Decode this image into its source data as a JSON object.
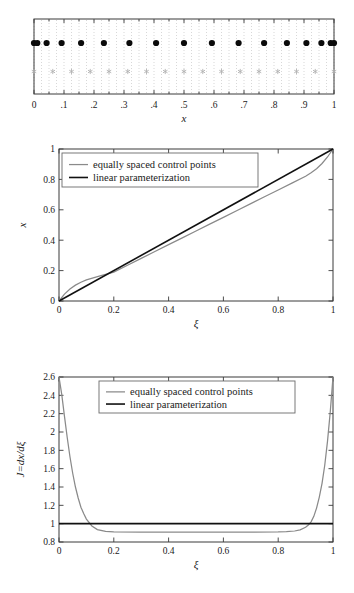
{
  "figure": {
    "caption_present": false,
    "panels": [
      "control-point-distribution",
      "parameterization-map",
      "jacobian"
    ]
  },
  "legend": {
    "entries": [
      {
        "label": "equally spaced control points",
        "color": "#8a8a8a",
        "style": "thin-gray-line"
      },
      {
        "label": "linear parameterization",
        "color": "#111111",
        "style": "thick-black-line"
      }
    ]
  },
  "chart_data": [
    {
      "id": "panel-top",
      "type": "scatter",
      "title": "",
      "xlabel": "x",
      "ylabel": "",
      "xlim": [
        0,
        1
      ],
      "ylim": [
        0,
        1
      ],
      "grid": true,
      "xticks": [
        0,
        0.1,
        0.2,
        0.3,
        0.4,
        0.5,
        0.6,
        0.7,
        0.8,
        0.9,
        1
      ],
      "xticklabels": [
        "0",
        ".1",
        ".2",
        ".3",
        ".4",
        ".5",
        ".6",
        ".7",
        ".8",
        ".9",
        "1"
      ],
      "yticks": [],
      "yticklabels": [],
      "series": [
        {
          "name": "equally spaced control points",
          "marker": "filled-circle",
          "color": "#0b0b0b",
          "y": 0.68,
          "x": [
            0.0,
            0.011,
            0.042,
            0.092,
            0.157,
            0.233,
            0.318,
            0.407,
            0.5,
            0.593,
            0.682,
            0.767,
            0.843,
            0.908,
            0.958,
            0.989,
            1.0
          ]
        },
        {
          "name": "linear parameterization",
          "marker": "asterisk",
          "color": "#b2b2b2",
          "y": 0.3,
          "x": [
            0.0,
            0.0625,
            0.125,
            0.1875,
            0.25,
            0.3125,
            0.375,
            0.4375,
            0.5,
            0.5625,
            0.625,
            0.6875,
            0.75,
            0.8125,
            0.875,
            0.9375,
            1.0
          ]
        }
      ]
    },
    {
      "id": "panel-middle",
      "type": "line",
      "title": "",
      "xlabel": "ξ",
      "ylabel": "x",
      "xlim": [
        0,
        1
      ],
      "ylim": [
        0,
        1
      ],
      "grid": false,
      "xticks": [
        0,
        0.2,
        0.4,
        0.6,
        0.8,
        1
      ],
      "xticklabels": [
        "0",
        "0.2",
        "0.4",
        "0.6",
        "0.8",
        "1"
      ],
      "yticks": [
        0,
        0.2,
        0.4,
        0.6,
        0.8,
        1
      ],
      "yticklabels": [
        "0",
        "0.2",
        "0.4",
        "0.6",
        "0.8",
        "1"
      ],
      "series": [
        {
          "name": "equally spaced control points",
          "color": "#8a8a8a",
          "x": [
            0.0,
            0.02,
            0.04,
            0.06,
            0.08,
            0.1,
            0.15,
            0.2,
            0.25,
            0.3,
            0.35,
            0.4,
            0.45,
            0.5,
            0.55,
            0.6,
            0.65,
            0.7,
            0.75,
            0.8,
            0.85,
            0.9,
            0.92,
            0.94,
            0.96,
            0.98,
            1.0
          ],
          "y": [
            0.0,
            0.0455,
            0.0795,
            0.1045,
            0.1235,
            0.1385,
            0.1655,
            0.1905,
            0.2355,
            0.2805,
            0.3255,
            0.3705,
            0.4155,
            0.4605,
            0.5055,
            0.5505,
            0.5955,
            0.6405,
            0.6855,
            0.7305,
            0.7755,
            0.8205,
            0.8435,
            0.8705,
            0.9045,
            0.9475,
            1.0
          ]
        },
        {
          "name": "linear parameterization",
          "color": "#111111",
          "x": [
            0,
            1
          ],
          "y": [
            0,
            1
          ]
        }
      ]
    },
    {
      "id": "panel-bottom",
      "type": "line",
      "title": "",
      "xlabel": "ξ",
      "ylabel": "J=dx/dξ",
      "xlim": [
        0,
        1
      ],
      "ylim": [
        0.8,
        2.6
      ],
      "grid": false,
      "xticks": [
        0,
        0.2,
        0.4,
        0.6,
        0.8,
        1
      ],
      "xticklabels": [
        "0",
        "0.2",
        "0.4",
        "0.6",
        "0.8",
        "1"
      ],
      "yticks": [
        0.8,
        1,
        1.2,
        1.4,
        1.6,
        1.8,
        2,
        2.2,
        2.4,
        2.6
      ],
      "yticklabels": [
        "0.8",
        "1",
        "1.2",
        "1.4",
        "1.6",
        "1.8",
        "2",
        "2.2",
        "2.4",
        "2.6"
      ],
      "series": [
        {
          "name": "equally spaced control points",
          "color": "#8a8a8a",
          "x": [
            0.0,
            0.01,
            0.02,
            0.03,
            0.04,
            0.05,
            0.06,
            0.07,
            0.08,
            0.09,
            0.1,
            0.12,
            0.14,
            0.17,
            0.2,
            0.3,
            0.4,
            0.5,
            0.6,
            0.7,
            0.8,
            0.83,
            0.86,
            0.88,
            0.9,
            0.91,
            0.92,
            0.93,
            0.94,
            0.95,
            0.96,
            0.97,
            0.98,
            0.99,
            1.0
          ],
          "y": [
            2.6,
            2.41,
            2.17,
            1.94,
            1.73,
            1.55,
            1.4,
            1.28,
            1.18,
            1.11,
            1.05,
            0.975,
            0.935,
            0.915,
            0.91,
            0.908,
            0.908,
            0.908,
            0.908,
            0.908,
            0.91,
            0.913,
            0.92,
            0.932,
            0.96,
            0.985,
            1.02,
            1.08,
            1.17,
            1.29,
            1.44,
            1.64,
            1.9,
            2.22,
            2.6
          ]
        },
        {
          "name": "linear parameterization",
          "color": "#111111",
          "x": [
            0,
            1
          ],
          "y": [
            1.0,
            1.0
          ]
        }
      ]
    }
  ]
}
